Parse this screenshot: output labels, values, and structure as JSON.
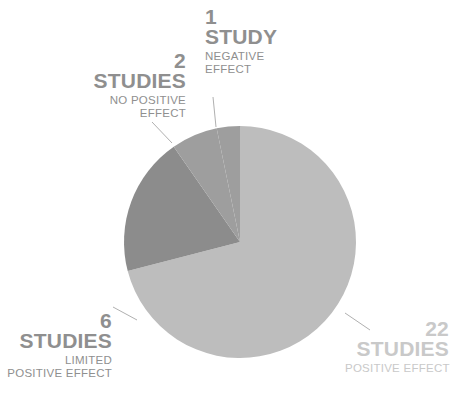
{
  "chart_data": {
    "type": "pie",
    "title": "",
    "subtitle": "",
    "xlabel": "",
    "ylabel": "",
    "total": 31,
    "units": "studies",
    "legend_position": "callout-labels",
    "grid": false,
    "start_angle_deg": 0,
    "direction": "clockwise",
    "categories": [
      "POSITIVE EFFECT",
      "LIMITED POSITIVE EFFECT",
      "NO POSITIVE EFFECT",
      "NEGATIVE EFFECT"
    ],
    "values": [
      22,
      6,
      2,
      1
    ],
    "colors": [
      "#bdbdbd",
      "#8c8c8c",
      "#9e9e9e",
      "#9e9e9e"
    ],
    "slices": [
      {
        "id": "positive",
        "count": "22",
        "unit": "STUDIES",
        "desc_line1": "POSITIVE EFFECT",
        "desc_line2": "",
        "value": 22,
        "color": "#bdbdbd",
        "label_color": "#c9c9c9",
        "start_deg": 0,
        "end_deg": 255.48
      },
      {
        "id": "limited",
        "count": "6",
        "unit": "STUDIES",
        "desc_line1": "LIMITED",
        "desc_line2": "POSITIVE EFFECT",
        "value": 6,
        "color": "#8c8c8c",
        "label_color": "#8f8f8f",
        "start_deg": 255.48,
        "end_deg": 325.16
      },
      {
        "id": "no-positive",
        "count": "2",
        "unit": "STUDIES",
        "desc_line1": "NO POSITIVE",
        "desc_line2": "EFFECT",
        "value": 2,
        "color": "#9e9e9e",
        "label_color": "#8f8f8f",
        "start_deg": 325.16,
        "end_deg": 348.39
      },
      {
        "id": "negative",
        "count": "1",
        "unit": "STUDY",
        "desc_line1": "NEGATIVE",
        "desc_line2": "EFFECT",
        "value": 1,
        "color": "#9e9e9e",
        "label_color": "#8f8f8f",
        "start_deg": 348.39,
        "end_deg": 360
      }
    ],
    "geometry": {
      "center_x": 240,
      "center_y": 242,
      "radius": 116
    },
    "background_color": "#ffffff",
    "leader_line_color": "#b0b0b0"
  }
}
